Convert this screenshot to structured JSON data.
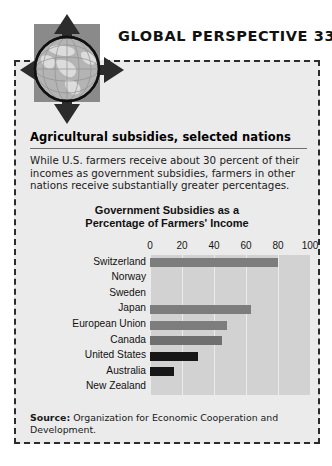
{
  "header": {
    "title": "GLOBAL PERSPECTIVE 33-2",
    "logo_icon": "globe-with-arrows-icon"
  },
  "panel": {
    "subhead": "Agricultural subsidies, selected nations",
    "blurb": "While U.S. farmers receive about 30 percent of their incomes as government subsidies, farmers in other nations receive substantially greater percentages.",
    "source_label": "Source:",
    "source_text": "Organization for Economic Cooperation and Development."
  },
  "chart_data": {
    "type": "bar",
    "orientation": "horizontal",
    "title": "Government Subsidies as a Percentage of Farmers' Income",
    "title_line1": "Government Subsidies as a",
    "title_line2": "Percentage of Farmers' Income",
    "xlabel": "",
    "ylabel": "",
    "xlim": [
      0,
      100
    ],
    "ticks": [
      0,
      20,
      40,
      60,
      80,
      100
    ],
    "tick_labels": [
      "0",
      "20",
      "40",
      "60",
      "80",
      "100"
    ],
    "grid": true,
    "legend": "none",
    "categories": [
      "Switzerland",
      "Norway",
      "Sweden",
      "Japan",
      "European Union",
      "Canada",
      "United States",
      "Australia",
      "New Zealand"
    ],
    "values": [
      80,
      0,
      0,
      63,
      48,
      45,
      30,
      15,
      0
    ],
    "bar_colors": [
      "#7d7d7d",
      "#d2d2d2",
      "#d2d2d2",
      "#7d7d7d",
      "#7d7d7d",
      "#6f6f6f",
      "#171717",
      "#171717",
      "#d2d2d2"
    ],
    "plot_background": "#d2d2d2",
    "gridline_color": "#ececec"
  },
  "colors": {
    "panel_background": "#ebebeb",
    "frame": "#2b2b2b",
    "logo_square": "#8a8a8a",
    "globe_ocean": "#b4b4b4",
    "globe_land": "#e2e2e2",
    "arrow": "#2c2c2c",
    "text": "#111111"
  }
}
